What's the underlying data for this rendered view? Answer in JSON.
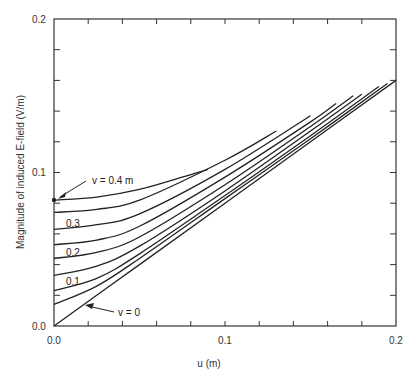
{
  "chart_data": {
    "type": "line",
    "title": "",
    "xlabel": "u  (m)",
    "ylabel": "Magnitude of induced  E-field (V/m)",
    "xlim": [
      0,
      0.2
    ],
    "ylim": [
      0,
      0.2
    ],
    "grid": false,
    "legend": "none (curves labeled inline)",
    "x_tick_labels": [
      "0.0",
      "0.1",
      "0.2"
    ],
    "y_tick_labels": [
      "0.0",
      "0.1",
      "0.2"
    ],
    "x_minor_ticks": [
      0.02,
      0.04,
      0.06,
      0.08,
      0.12,
      0.14,
      0.16,
      0.18
    ],
    "y_minor_ticks": [
      0.02,
      0.04,
      0.06,
      0.08,
      0.12,
      0.14,
      0.16,
      0.18
    ],
    "annotations": [
      {
        "text": "v = 0.4 m",
        "points_to": [
          0.0,
          0.082
        ]
      },
      {
        "text": "0.3",
        "near": [
          0.012,
          0.064
        ]
      },
      {
        "text": "0.2",
        "near": [
          0.012,
          0.047
        ]
      },
      {
        "text": "0.1",
        "near": [
          0.012,
          0.029
        ]
      },
      {
        "text": "v = 0",
        "points_to": [
          0.016,
          0.013
        ]
      }
    ],
    "series": [
      {
        "name": "v = 0",
        "x": [
          0,
          0.05,
          0.1,
          0.15,
          0.2
        ],
        "y": [
          0,
          0.04,
          0.08,
          0.12,
          0.16
        ]
      },
      {
        "name": "v = 0.05",
        "x": [
          0,
          0.025,
          0.05,
          0.1,
          0.15,
          0.195
        ],
        "y": [
          0.014,
          0.026,
          0.044,
          0.083,
          0.122,
          0.158
        ]
      },
      {
        "name": "v = 0.1",
        "x": [
          0,
          0.025,
          0.05,
          0.1,
          0.15,
          0.19
        ],
        "y": [
          0.023,
          0.031,
          0.047,
          0.085,
          0.124,
          0.156
        ]
      },
      {
        "name": "v = 0.15",
        "x": [
          0,
          0.025,
          0.05,
          0.1,
          0.15,
          0.18
        ],
        "y": [
          0.033,
          0.039,
          0.052,
          0.088,
          0.127,
          0.151
        ]
      },
      {
        "name": "v = 0.2",
        "x": [
          0,
          0.025,
          0.05,
          0.1,
          0.15,
          0.175
        ],
        "y": [
          0.044,
          0.048,
          0.058,
          0.092,
          0.13,
          0.15
        ]
      },
      {
        "name": "v = 0.25",
        "x": [
          0,
          0.025,
          0.05,
          0.1,
          0.15,
          0.165
        ],
        "y": [
          0.053,
          0.056,
          0.065,
          0.097,
          0.133,
          0.145
        ]
      },
      {
        "name": "v = 0.3",
        "x": [
          0,
          0.025,
          0.05,
          0.1,
          0.15
        ],
        "y": [
          0.063,
          0.066,
          0.073,
          0.102,
          0.137
        ]
      },
      {
        "name": "v = 0.35",
        "x": [
          0,
          0.025,
          0.05,
          0.1,
          0.13
        ],
        "y": [
          0.074,
          0.076,
          0.082,
          0.108,
          0.127
        ]
      },
      {
        "name": "v = 0.4",
        "x": [
          0,
          0.025,
          0.05,
          0.075,
          0.09
        ],
        "y": [
          0.082,
          0.084,
          0.089,
          0.097,
          0.102
        ]
      }
    ]
  },
  "labels": {
    "y_top": "0.2",
    "y_mid": "0.1",
    "y_zero": "0.0",
    "x_zero": "0.0",
    "x_mid": "0.1",
    "x_right": "0.2",
    "xlabel": "u  (m)",
    "ylabel": "Magnitude of induced  E-field (V/m)",
    "annot_v04": "v = 0.4 m",
    "annot_03": "0.3",
    "annot_02": "0.2",
    "annot_01": "0.1",
    "annot_v0": "v = 0"
  }
}
